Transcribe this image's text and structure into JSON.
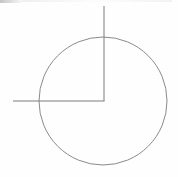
{
  "figure": {
    "background_color": "#fefefe",
    "stroke_color": "#7d7d7d",
    "stroke_width": 1,
    "canvas": {
      "width": 178,
      "height": 177
    },
    "circle": {
      "name": "circle-outline",
      "center_x": 103,
      "center_y": 101,
      "radius": 64,
      "stroke_color": "#8a8a8a",
      "stroke_width": 1,
      "fill": "none"
    },
    "vertical_line": {
      "name": "vertical-line",
      "x1": 104,
      "y1": 6,
      "x2": 104,
      "y2": 101,
      "stroke_color": "#7d7d7d",
      "stroke_width": 1
    },
    "horizontal_line": {
      "name": "horizontal-line",
      "x1": 13,
      "y1": 101,
      "x2": 104,
      "y2": 101,
      "stroke_color": "#7d7d7d",
      "stroke_width": 1
    },
    "corner_point": {
      "name": "corner-vertex",
      "x": 104,
      "y": 101
    },
    "marks": [
      {
        "name": "smudge-top-left",
        "x": 0,
        "y": 0,
        "width": 22,
        "height": 3
      },
      {
        "name": "smudge-top-band",
        "x": 22,
        "y": 0,
        "width": 150,
        "height": 2
      }
    ]
  }
}
